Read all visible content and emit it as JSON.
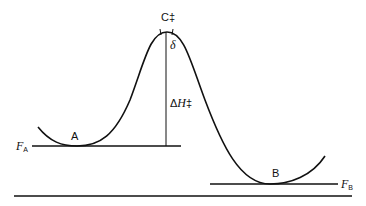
{
  "diagram": {
    "type": "energy-profile",
    "labels": {
      "transition_state": "C‡",
      "delta": "δ",
      "enthalpy_symbol": "Δ",
      "enthalpy_var": "H",
      "enthalpy_dagger": "‡",
      "state_a": "A",
      "state_b": "B",
      "level_a_var": "F",
      "level_a_sub": "A",
      "level_b_var": "F",
      "level_b_sub": "B"
    },
    "colors": {
      "stroke": "#111111",
      "background": "#ffffff"
    }
  }
}
